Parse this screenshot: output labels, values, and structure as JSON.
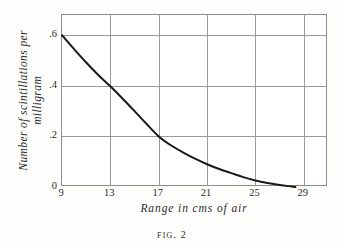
{
  "figure": {
    "caption_prefix": "Fig.",
    "caption_number": "2",
    "background_color": "#fdfdfc",
    "ink_color": "#1a1a1a",
    "grid_color": "#9a9a9a",
    "frame_color": "#8d8d8d"
  },
  "chart_data": {
    "type": "line",
    "title": "",
    "xlabel": "Range in cms of air",
    "ylabel_line1": "Number of scintillations per",
    "ylabel_line2": "milligram",
    "ylabel": "Number of scintillations per milligram",
    "xlim": [
      9,
      31
    ],
    "ylim": [
      0,
      0.68
    ],
    "xticks": [
      9,
      13,
      17,
      21,
      25,
      29
    ],
    "xticklabels": [
      "9",
      "13",
      "17",
      "21",
      "25",
      "29"
    ],
    "yticks": [
      0,
      0.2,
      0.4,
      0.6
    ],
    "yticklabels": [
      "0",
      ".2",
      ".4",
      ".6"
    ],
    "grid": true,
    "gridlines_x": [
      13,
      17,
      21,
      25,
      29
    ],
    "gridlines_y": [
      0.2,
      0.4,
      0.6
    ],
    "legend": null,
    "series": [
      {
        "name": "scintillations per milligram",
        "x": [
          9.0,
          10.0,
          11.0,
          12.0,
          13.0,
          14.0,
          15.0,
          16.0,
          17.0,
          18.0,
          19.0,
          20.0,
          21.0,
          22.0,
          23.0,
          24.0,
          25.0,
          26.0,
          27.0,
          28.0,
          28.3
        ],
        "y": [
          0.6,
          0.545,
          0.492,
          0.443,
          0.398,
          0.35,
          0.3,
          0.249,
          0.2,
          0.165,
          0.137,
          0.112,
          0.09,
          0.071,
          0.055,
          0.039,
          0.026,
          0.016,
          0.008,
          0.002,
          0.0
        ]
      }
    ],
    "annotations": []
  }
}
